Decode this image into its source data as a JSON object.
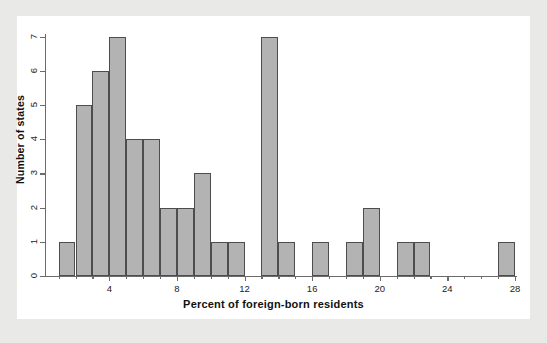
{
  "chart_data": {
    "type": "bar",
    "title": "",
    "subtitle": "",
    "xlabel": "Percent of foreign-born residents",
    "ylabel": "Number of states",
    "xlim": [
      1,
      28
    ],
    "ylim": [
      0,
      7
    ],
    "bin_width": 1,
    "grid": false,
    "legend": null,
    "xticks": [
      4,
      8,
      12,
      16,
      20,
      24,
      28
    ],
    "xtick_labels": [
      "4",
      "8",
      "12",
      "16",
      "20",
      "24",
      "28"
    ],
    "yticks": [
      0,
      1,
      2,
      3,
      4,
      5,
      6,
      7
    ],
    "ytick_labels": [
      "0",
      "1",
      "2",
      "3",
      "4",
      "5",
      "6",
      "7"
    ],
    "bin_edges": [
      1,
      2,
      3,
      4,
      5,
      6,
      7,
      8,
      9,
      10,
      11,
      12,
      13,
      14,
      15,
      16,
      17,
      18,
      19,
      20,
      21,
      22,
      23,
      24,
      25,
      26,
      27,
      28
    ],
    "categories": [
      "1-2",
      "2-3",
      "3-4",
      "4-5",
      "5-6",
      "6-7",
      "7-8",
      "8-9",
      "9-10",
      "10-11",
      "11-12",
      "12-13",
      "13-14",
      "14-15",
      "15-16",
      "16-17",
      "17-18",
      "18-19",
      "19-20",
      "20-21",
      "21-22",
      "22-23",
      "23-24",
      "24-25",
      "25-26",
      "26-27",
      "27-28"
    ],
    "values": [
      1,
      5,
      6,
      7,
      4,
      4,
      2,
      2,
      3,
      1,
      1,
      0,
      7,
      1,
      0,
      1,
      0,
      1,
      2,
      0,
      1,
      1,
      0,
      0,
      0,
      0,
      1
    ],
    "bars": [
      {
        "x0": 1,
        "x1": 2,
        "count": 1
      },
      {
        "x0": 2,
        "x1": 3,
        "count": 5
      },
      {
        "x0": 3,
        "x1": 4,
        "count": 6
      },
      {
        "x0": 4,
        "x1": 5,
        "count": 7
      },
      {
        "x0": 5,
        "x1": 6,
        "count": 4
      },
      {
        "x0": 6,
        "x1": 7,
        "count": 4
      },
      {
        "x0": 7,
        "x1": 8,
        "count": 2
      },
      {
        "x0": 8,
        "x1": 9,
        "count": 2
      },
      {
        "x0": 9,
        "x1": 10,
        "count": 3
      },
      {
        "x0": 10,
        "x1": 11,
        "count": 1
      },
      {
        "x0": 11,
        "x1": 12,
        "count": 1
      },
      {
        "x0": 13,
        "x1": 14,
        "count": 7
      },
      {
        "x0": 14,
        "x1": 15,
        "count": 1
      },
      {
        "x0": 16,
        "x1": 17,
        "count": 1
      },
      {
        "x0": 18,
        "x1": 19,
        "count": 1
      },
      {
        "x0": 19,
        "x1": 20,
        "count": 2
      },
      {
        "x0": 21,
        "x1": 22,
        "count": 1
      },
      {
        "x0": 22,
        "x1": 23,
        "count": 1
      },
      {
        "x0": 27,
        "x1": 28,
        "count": 1
      }
    ],
    "colors": {
      "bar_fill": "#b3b3b3",
      "bar_border": "#4d4d4d",
      "axis": "#6b6b6b",
      "plot_background": "#ffffff",
      "figure_background": "#e9e9e7",
      "text": "#111111"
    }
  }
}
